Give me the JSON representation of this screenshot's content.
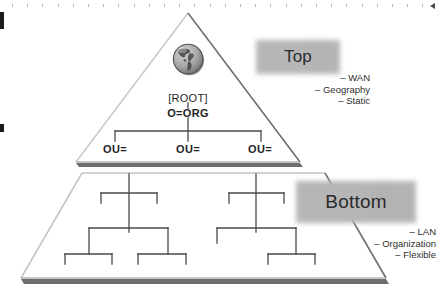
{
  "figure": {
    "colors": {
      "ink": "#2b2b2b",
      "triangle_edge_light": "#c9c9c9",
      "triangle_edge_dark": "#6f6f6f",
      "shadow_bar": "#6e6e6e",
      "cloud_fill": "#b4b4b4",
      "tree_line": "#4a4a4a",
      "globe_land": "#5a5a5a",
      "globe_ocean": "#a8a8a8"
    }
  },
  "top_section": {
    "cloud_label": "Top",
    "bullets": [
      "– WAN",
      "– Geography",
      "– Static"
    ],
    "globe_icon": "globe-americas-icon",
    "tree": {
      "root_label": "[ROOT]",
      "org_label": "O=ORG",
      "ou_labels": [
        "OU=",
        "OU=",
        "OU="
      ]
    }
  },
  "bottom_section": {
    "cloud_label": "Bottom",
    "bullets": [
      "– LAN",
      "– Organization",
      "– Flexible"
    ]
  },
  "artifacts": {
    "ruler_tick_count": 28,
    "ruler_arrow": "left-arrow-icon",
    "edge_marks": 2
  }
}
